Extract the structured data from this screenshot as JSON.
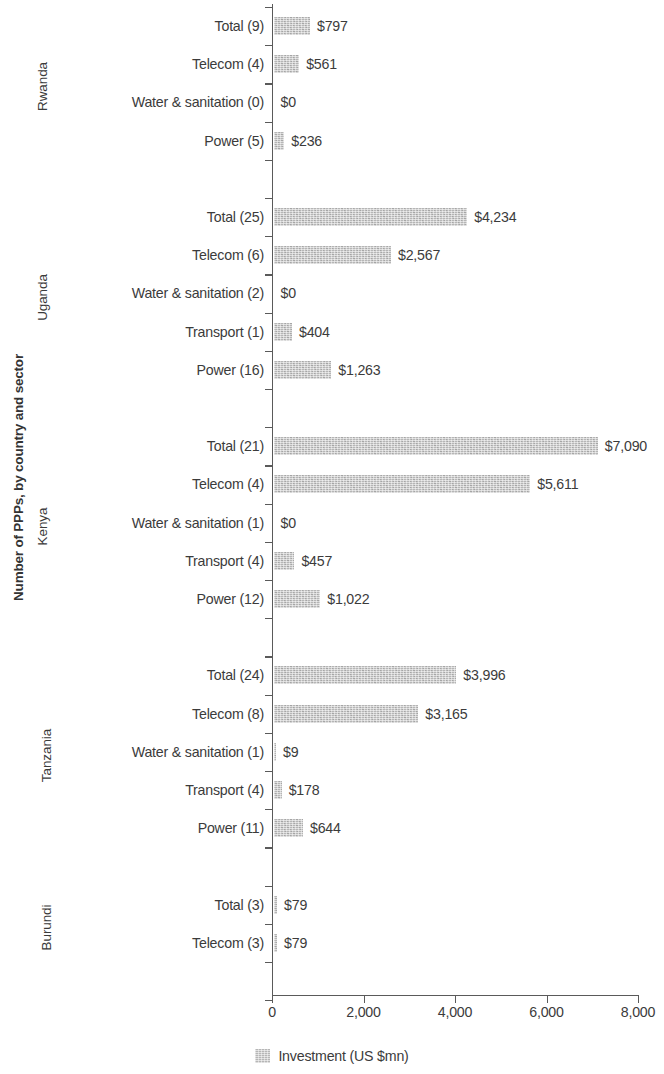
{
  "chart_data": {
    "type": "bar",
    "orientation": "horizontal",
    "title": "",
    "ylabel": "Number of PPPs, by country and sector",
    "xlabel": "",
    "xlim": [
      0,
      8000
    ],
    "xticks": [
      "0",
      "2,000",
      "4,000",
      "6,000",
      "8,000"
    ],
    "xtick_values": [
      0,
      2000,
      4000,
      6000,
      8000
    ],
    "grid": false,
    "legend": {
      "position": "bottom",
      "entries": [
        {
          "label": "Investment (US $mn)",
          "color": "#b6b6b6"
        }
      ]
    },
    "bar_color": "#b6b6b6",
    "groups": [
      {
        "country": "Rwanda",
        "rows": [
          {
            "label": "Total (9)",
            "sector": "Total",
            "count": 9,
            "value": 797,
            "value_label": "$797"
          },
          {
            "label": "Telecom (4)",
            "sector": "Telecom",
            "count": 4,
            "value": 561,
            "value_label": "$561"
          },
          {
            "label": "Water & sanitation (0)",
            "sector": "Water & sanitation",
            "count": 0,
            "value": 0,
            "value_label": "$0"
          },
          {
            "label": "Power (5)",
            "sector": "Power",
            "count": 5,
            "value": 236,
            "value_label": "$236"
          }
        ]
      },
      {
        "country": "Uganda",
        "rows": [
          {
            "label": "Total (25)",
            "sector": "Total",
            "count": 25,
            "value": 4234,
            "value_label": "$4,234"
          },
          {
            "label": "Telecom (6)",
            "sector": "Telecom",
            "count": 6,
            "value": 2567,
            "value_label": "$2,567"
          },
          {
            "label": "Water & sanitation (2)",
            "sector": "Water & sanitation",
            "count": 2,
            "value": 0,
            "value_label": "$0"
          },
          {
            "label": "Transport (1)",
            "sector": "Transport",
            "count": 1,
            "value": 404,
            "value_label": "$404"
          },
          {
            "label": "Power (16)",
            "sector": "Power",
            "count": 16,
            "value": 1263,
            "value_label": "$1,263"
          }
        ]
      },
      {
        "country": "Kenya",
        "rows": [
          {
            "label": "Total (21)",
            "sector": "Total",
            "count": 21,
            "value": 7090,
            "value_label": "$7,090"
          },
          {
            "label": "Telecom (4)",
            "sector": "Telecom",
            "count": 4,
            "value": 5611,
            "value_label": "$5,611"
          },
          {
            "label": "Water & sanitation (1)",
            "sector": "Water & sanitation",
            "count": 1,
            "value": 0,
            "value_label": "$0"
          },
          {
            "label": "Transport (4)",
            "sector": "Transport",
            "count": 4,
            "value": 457,
            "value_label": "$457"
          },
          {
            "label": "Power (12)",
            "sector": "Power",
            "count": 12,
            "value": 1022,
            "value_label": "$1,022"
          }
        ]
      },
      {
        "country": "Tanzania",
        "rows": [
          {
            "label": "Total (24)",
            "sector": "Total",
            "count": 24,
            "value": 3996,
            "value_label": "$3,996"
          },
          {
            "label": "Telecom (8)",
            "sector": "Telecom",
            "count": 8,
            "value": 3165,
            "value_label": "$3,165"
          },
          {
            "label": "Water & sanitation (1)",
            "sector": "Water & sanitation",
            "count": 1,
            "value": 9,
            "value_label": "$9"
          },
          {
            "label": "Transport (4)",
            "sector": "Transport",
            "count": 4,
            "value": 178,
            "value_label": "$178"
          },
          {
            "label": "Power (11)",
            "sector": "Power",
            "count": 11,
            "value": 644,
            "value_label": "$644"
          }
        ]
      },
      {
        "country": "Burundi",
        "rows": [
          {
            "label": "Total (3)",
            "sector": "Total",
            "count": 3,
            "value": 79,
            "value_label": "$79"
          },
          {
            "label": "Telecom (3)",
            "sector": "Telecom",
            "count": 3,
            "value": 79,
            "value_label": "$79"
          }
        ]
      }
    ]
  }
}
